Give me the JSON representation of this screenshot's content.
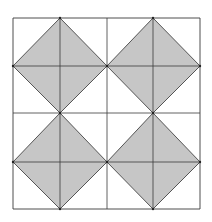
{
  "diagram": {
    "grid": {
      "x_lines": [
        13,
        60,
        107,
        153,
        200
      ],
      "y_lines": [
        18,
        66,
        113,
        162,
        209
      ],
      "line_color": "#3a3a3a"
    },
    "diamonds": [
      {
        "points": "60,18 107,66 60,113 13,66"
      },
      {
        "points": "153,18 200,66 153,113 107,66"
      },
      {
        "points": "60,113 107,162 60,209 13,162"
      },
      {
        "points": "153,113 200,162 153,209 107,162"
      }
    ],
    "fill_color": "#c6c6c6",
    "diamond_edge_color": "#555555"
  }
}
